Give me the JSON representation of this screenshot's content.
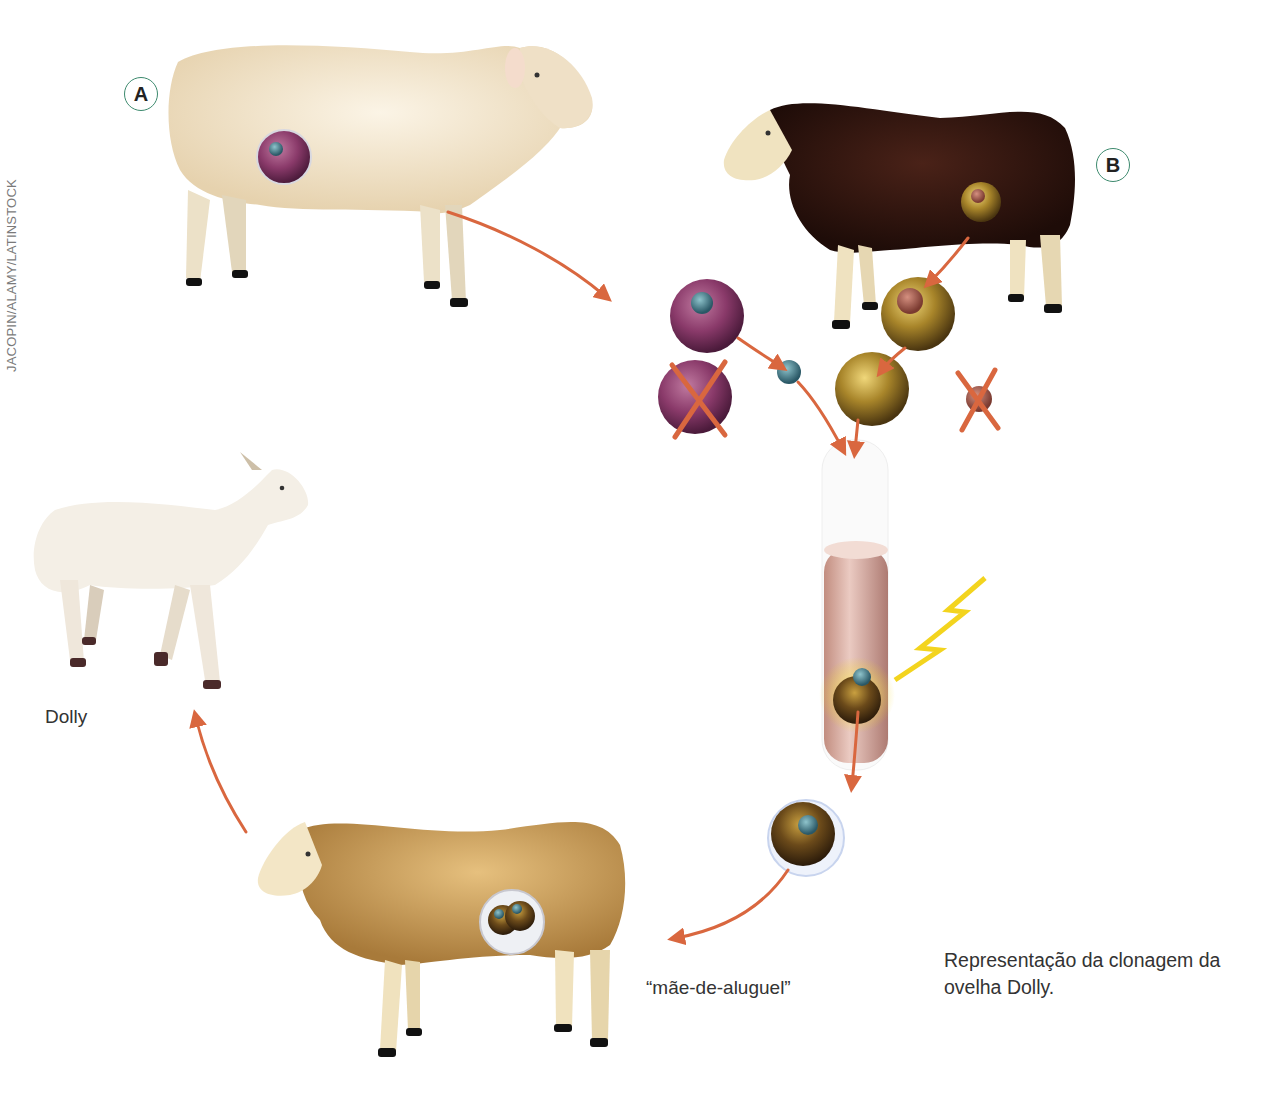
{
  "credit": "JACOPIN/ALAMY/LATINSTOCK",
  "badges": {
    "a": "A",
    "b": "B"
  },
  "labels": {
    "dolly": "Dolly",
    "surrogate": "“mãe-de-aluguel”"
  },
  "caption": {
    "line1": "Representação da clonagem da",
    "line2": "ovelha Dolly."
  },
  "colors": {
    "arrow": "#d9673f",
    "sheep_a_wool": "#f3e6cf",
    "sheep_b_wool": "#2e1410",
    "surrogate_wool": "#d4a55e",
    "lamb_wool": "#f4efe6",
    "cell_pink": "#8a3a6a",
    "cell_gold": "#a8852a",
    "nucleus_blue": "#3f7d8a",
    "badge_ring": "#3d8a6e",
    "spark": "#f3d41e"
  },
  "steps": [
    {
      "id": "sheep-a",
      "desc": "white sheep A, donor of somatic (udder) cell"
    },
    {
      "id": "sheep-b",
      "desc": "black-faced sheep B, donor of egg cell"
    },
    {
      "id": "nucleus-transfer",
      "desc": "nucleus of A inserted into enucleated egg of B"
    },
    {
      "id": "electric-fusion",
      "desc": "cell fusion stimulated by electric shock in tube"
    },
    {
      "id": "embryo",
      "desc": "resulting embryo"
    },
    {
      "id": "surrogate",
      "desc": "embryo implanted in surrogate mother"
    },
    {
      "id": "dolly",
      "desc": "Dolly the lamb is born"
    }
  ]
}
